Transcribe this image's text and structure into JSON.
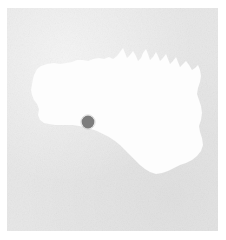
{
  "view": {
    "kind": "segmentation-mask-tile",
    "width_px": 226,
    "height_px": 240,
    "page_background_color": "#ffffff",
    "plate": {
      "x_px": 7,
      "y_px": 8,
      "width_px": 211,
      "height_px": 223,
      "background_color": "#e7e7e7",
      "texture": "fine-grain-noise"
    }
  },
  "mask": {
    "label": "mask-region",
    "fill_color": "#fdfdfd",
    "outline": "irregular-blob",
    "bounds_px": {
      "left": 31,
      "top": 62,
      "right": 204,
      "bottom": 185
    }
  },
  "marker": {
    "label": "point-marker",
    "shape": "filled-circle",
    "fill_color": "#7d7d7d",
    "center_x_px": 88,
    "center_y_px": 122,
    "radius_px": 6.5
  }
}
